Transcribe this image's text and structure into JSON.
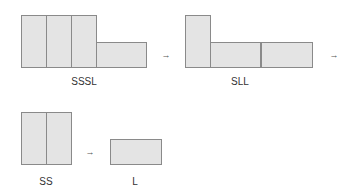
{
  "diagram": {
    "groups": [
      {
        "id": "sssl",
        "label": "SSSL",
        "label_pos": [
          84,
          76
        ],
        "shapes": [
          {
            "type": "S",
            "x": 21,
            "y": 15,
            "w": 26,
            "h": 53
          },
          {
            "type": "S",
            "x": 46,
            "y": 15,
            "w": 26,
            "h": 53
          },
          {
            "type": "S",
            "x": 71,
            "y": 15,
            "w": 26,
            "h": 53
          },
          {
            "type": "L",
            "x": 96,
            "y": 42,
            "w": 51,
            "h": 26
          }
        ]
      },
      {
        "id": "sll",
        "label": "SLL",
        "label_pos": [
          240,
          76
        ],
        "shapes": [
          {
            "type": "S",
            "x": 185,
            "y": 15,
            "w": 26,
            "h": 53
          },
          {
            "type": "L",
            "x": 210,
            "y": 42,
            "w": 51,
            "h": 26
          },
          {
            "type": "L",
            "x": 261,
            "y": 42,
            "w": 52,
            "h": 26
          }
        ]
      },
      {
        "id": "ss",
        "label": "SS",
        "label_pos": [
          46,
          176
        ],
        "shapes": [
          {
            "type": "S",
            "x": 21,
            "y": 112,
            "w": 26,
            "h": 53
          },
          {
            "type": "S",
            "x": 46,
            "y": 112,
            "w": 26,
            "h": 53
          }
        ]
      },
      {
        "id": "l",
        "label": "L",
        "label_pos": [
          135,
          176
        ],
        "shapes": [
          {
            "type": "L",
            "x": 110,
            "y": 139,
            "w": 52,
            "h": 26
          }
        ]
      }
    ],
    "arrows": [
      {
        "glyph": "→",
        "x": 166,
        "y": 55
      },
      {
        "glyph": "→",
        "x": 334,
        "y": 55
      },
      {
        "glyph": "→",
        "x": 90,
        "y": 152
      }
    ],
    "colors": {
      "fill": "#e4e4e4",
      "stroke": "#8a8a8a"
    }
  }
}
